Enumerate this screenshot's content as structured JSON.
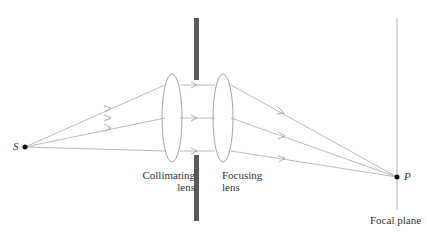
{
  "labels": {
    "source": "S",
    "point": "P",
    "collimating_line1": "Collimating",
    "collimating_line2": "lens",
    "focusing_line1": "Focusing",
    "focusing_line2": "lens",
    "focal_plane": "Focal plane"
  },
  "colors": {
    "ray": "#a8a8a8",
    "lens": "#8a8a8a",
    "barrier": "#5a5a5a",
    "plane": "#b0b0b0",
    "point": "#111111"
  }
}
